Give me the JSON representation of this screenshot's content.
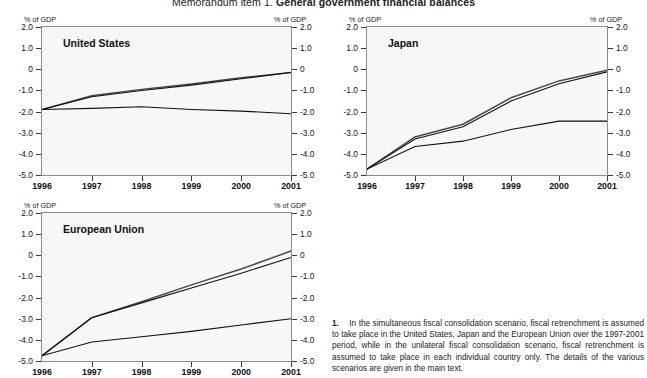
{
  "figure": {
    "title_prefix": "Memorandum item 1.",
    "title_main": "General government financial balances",
    "axis_unit": "% of GDP"
  },
  "footnote": {
    "number": "1.",
    "text": "In the simultaneous fiscal consolidation scenario, fiscal retrenchment is assumed to take place in the United States, Japan and the European Union over the 1997-2001 period, while in the unilateral fiscal consolidation scenario, fiscal retrenchment is assumed to take place in each individual country only. The details of the various scenarios are given in the main text."
  },
  "chart_data": [
    {
      "type": "line",
      "title": "United States",
      "xlabel": "",
      "ylabel": "% of GDP",
      "x": [
        1996,
        1997,
        1998,
        1999,
        2000,
        2001
      ],
      "xtick_labels": [
        "1996",
        "1997",
        "1998",
        "1999",
        "2000",
        "2001"
      ],
      "xlim": [
        1996,
        2001
      ],
      "ylim": [
        -5.0,
        2.0
      ],
      "ytick_labels": [
        "2.0",
        "1.0",
        "0",
        "-1.0",
        "-2.0",
        "-3.0",
        "-4.0",
        "-5.0"
      ],
      "ytick_values": [
        2.0,
        1.0,
        0,
        -1.0,
        -2.0,
        -3.0,
        -4.0,
        -5.0
      ],
      "grid": false,
      "legend": "none",
      "series": [
        {
          "name": "Simultaneous fiscal consolidation",
          "values": [
            -1.9,
            -1.25,
            -0.95,
            -0.7,
            -0.4,
            -0.15
          ]
        },
        {
          "name": "Unilateral fiscal consolidation",
          "values": [
            -1.9,
            -1.3,
            -1.0,
            -0.75,
            -0.45,
            -0.15
          ]
        },
        {
          "name": "Baseline",
          "values": [
            -1.9,
            -1.85,
            -1.77,
            -1.9,
            -1.98,
            -2.1
          ]
        }
      ]
    },
    {
      "type": "line",
      "title": "Japan",
      "xlabel": "",
      "ylabel": "% of GDP",
      "x": [
        1996,
        1997,
        1998,
        1999,
        2000,
        2001
      ],
      "xtick_labels": [
        "1996",
        "1997",
        "1998",
        "1999",
        "2000",
        "2001"
      ],
      "xlim": [
        1996,
        2001
      ],
      "ylim": [
        -5.0,
        2.0
      ],
      "ytick_labels": [
        "2.0",
        "1.0",
        "0",
        "-1.0",
        "-2.0",
        "-3.0",
        "-4.0",
        "-5.0"
      ],
      "ytick_values": [
        2.0,
        1.0,
        0,
        -1.0,
        -2.0,
        -3.0,
        -4.0,
        -5.0
      ],
      "grid": false,
      "legend": "none",
      "series": [
        {
          "name": "Simultaneous fiscal consolidation",
          "values": [
            -4.72,
            -3.2,
            -2.6,
            -1.35,
            -0.55,
            -0.05
          ]
        },
        {
          "name": "Unilateral fiscal consolidation",
          "values": [
            -4.72,
            -3.3,
            -2.72,
            -1.5,
            -0.68,
            -0.12
          ]
        },
        {
          "name": "Baseline",
          "values": [
            -4.72,
            -3.65,
            -3.4,
            -2.85,
            -2.45,
            -2.45
          ]
        }
      ]
    },
    {
      "type": "line",
      "title": "European Union",
      "xlabel": "",
      "ylabel": "% of GDP",
      "x": [
        1996,
        1997,
        1998,
        1999,
        2000,
        2001
      ],
      "xtick_labels": [
        "1996",
        "1997",
        "1998",
        "1999",
        "2000",
        "2001"
      ],
      "xlim": [
        1996,
        2001
      ],
      "ylim": [
        -5.0,
        2.0
      ],
      "ytick_labels": [
        "2.0",
        "1.0",
        "0",
        "-1.0",
        "-2.0",
        "-3.0",
        "-4.0",
        "-5.0"
      ],
      "ytick_values": [
        2.0,
        1.0,
        0,
        -1.0,
        -2.0,
        -3.0,
        -4.0,
        -5.0
      ],
      "grid": false,
      "legend": "none",
      "series": [
        {
          "name": "Simultaneous fiscal consolidation",
          "values": [
            -4.75,
            -2.95,
            -2.2,
            -1.4,
            -0.65,
            0.2
          ]
        },
        {
          "name": "Unilateral fiscal consolidation",
          "values": [
            -4.75,
            -2.95,
            -2.25,
            -1.55,
            -0.85,
            -0.1
          ]
        },
        {
          "name": "Baseline",
          "values": [
            -4.75,
            -4.1,
            -3.85,
            -3.6,
            -3.3,
            -3.0
          ]
        }
      ]
    }
  ],
  "panels": [
    {
      "key": "us",
      "left": 41,
      "top": 26,
      "width": 251,
      "height": 150
    },
    {
      "key": "japan",
      "left": 366,
      "top": 26,
      "width": 242,
      "height": 150
    },
    {
      "key": "eu",
      "left": 41,
      "top": 212,
      "width": 251,
      "height": 150
    }
  ]
}
